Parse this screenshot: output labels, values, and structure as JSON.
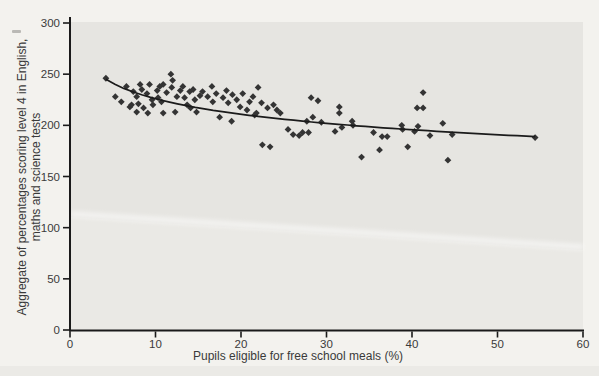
{
  "chart_data": {
    "type": "scatter",
    "title": "",
    "xlabel": "Pupils eligible for free school meals (%)",
    "ylabel_lines": [
      "Aggregate of percentages scoring level 4 in English,",
      "maths and science tests"
    ],
    "xlim": [
      0,
      60
    ],
    "ylim": [
      0,
      300
    ],
    "xticks": [
      0,
      10,
      20,
      30,
      40,
      50,
      60
    ],
    "yticks": [
      0,
      50,
      100,
      150,
      200,
      250,
      300
    ],
    "grid": false,
    "legend": null,
    "marker": "diamond",
    "points": [
      [
        4.2,
        246
      ],
      [
        5.3,
        228
      ],
      [
        6.0,
        223
      ],
      [
        6.6,
        238
      ],
      [
        7.0,
        218
      ],
      [
        7.2,
        220
      ],
      [
        7.4,
        233
      ],
      [
        7.8,
        213
      ],
      [
        7.8,
        228
      ],
      [
        8.0,
        221
      ],
      [
        8.2,
        240
      ],
      [
        8.4,
        235
      ],
      [
        8.6,
        217
      ],
      [
        9.0,
        231
      ],
      [
        9.1,
        212
      ],
      [
        9.3,
        240
      ],
      [
        9.6,
        225
      ],
      [
        9.7,
        220
      ],
      [
        10.2,
        234
      ],
      [
        10.3,
        227
      ],
      [
        10.5,
        238
      ],
      [
        10.7,
        223
      ],
      [
        10.9,
        240
      ],
      [
        10.9,
        212
      ],
      [
        11.3,
        232
      ],
      [
        11.8,
        250
      ],
      [
        11.9,
        237
      ],
      [
        12.0,
        244
      ],
      [
        12.3,
        213
      ],
      [
        12.5,
        228
      ],
      [
        12.9,
        234
      ],
      [
        13.2,
        238
      ],
      [
        13.4,
        227
      ],
      [
        13.7,
        220
      ],
      [
        14.0,
        233
      ],
      [
        14.1,
        217
      ],
      [
        14.4,
        235
      ],
      [
        14.6,
        225
      ],
      [
        14.8,
        213
      ],
      [
        15.2,
        229
      ],
      [
        15.5,
        233
      ],
      [
        16.1,
        228
      ],
      [
        16.6,
        238
      ],
      [
        16.7,
        223
      ],
      [
        17.1,
        231
      ],
      [
        17.5,
        208
      ],
      [
        17.9,
        227
      ],
      [
        18.3,
        234
      ],
      [
        18.5,
        222
      ],
      [
        18.9,
        204
      ],
      [
        19.0,
        230
      ],
      [
        19.5,
        225
      ],
      [
        19.9,
        218
      ],
      [
        20.2,
        231
      ],
      [
        20.7,
        215
      ],
      [
        21.0,
        223
      ],
      [
        21.4,
        228
      ],
      [
        21.6,
        210
      ],
      [
        21.8,
        212
      ],
      [
        22.0,
        237
      ],
      [
        22.4,
        222
      ],
      [
        22.5,
        181
      ],
      [
        23.1,
        217
      ],
      [
        23.4,
        179
      ],
      [
        23.8,
        220
      ],
      [
        24.2,
        215
      ],
      [
        24.6,
        212
      ],
      [
        25.5,
        196
      ],
      [
        26.1,
        191
      ],
      [
        26.8,
        190
      ],
      [
        27.2,
        193
      ],
      [
        27.7,
        204
      ],
      [
        27.9,
        193
      ],
      [
        28.2,
        227
      ],
      [
        28.4,
        208
      ],
      [
        29.0,
        224
      ],
      [
        29.4,
        203
      ],
      [
        31.0,
        194
      ],
      [
        31.5,
        212
      ],
      [
        31.5,
        218
      ],
      [
        31.8,
        198
      ],
      [
        33.0,
        204
      ],
      [
        33.1,
        200
      ],
      [
        34.1,
        169
      ],
      [
        35.5,
        193
      ],
      [
        36.2,
        176
      ],
      [
        36.5,
        189
      ],
      [
        37.1,
        189
      ],
      [
        38.8,
        200
      ],
      [
        38.9,
        196
      ],
      [
        39.5,
        179
      ],
      [
        40.3,
        194
      ],
      [
        40.6,
        217
      ],
      [
        40.7,
        199
      ],
      [
        41.3,
        217
      ],
      [
        41.3,
        232
      ],
      [
        42.1,
        190
      ],
      [
        43.6,
        202
      ],
      [
        44.2,
        166
      ],
      [
        44.7,
        191
      ],
      [
        54.4,
        188
      ]
    ],
    "trendline": {
      "model": "y = 276.3 - 21.85*ln(x)",
      "a": 276.3,
      "b": -21.85,
      "x_start": 4.2,
      "x_end": 54.4
    },
    "colors": {
      "marker": "#343434",
      "trend": "#1b1b1b",
      "plot_bg": "#e6e5e1",
      "page_bg": "#f3f2ee",
      "axis": "#1a1a1a",
      "text": "#3a3a3a"
    }
  }
}
